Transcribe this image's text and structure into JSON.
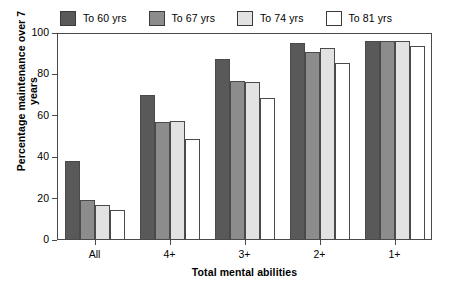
{
  "chart_data": {
    "type": "bar",
    "title": "",
    "xlabel": "Total mental abilities",
    "ylabel": "Percentage maintenance over 7 years",
    "categories": [
      "All",
      "4+",
      "3+",
      "2+",
      "1+"
    ],
    "ylim": [
      0,
      100
    ],
    "yticks": [
      0,
      20,
      40,
      60,
      80,
      100
    ],
    "grid": false,
    "legend_position": "top",
    "series": [
      {
        "name": "To 60 yrs",
        "color": "#595959",
        "values": [
          38,
          70,
          87.5,
          95,
          96
        ]
      },
      {
        "name": "To 67 yrs",
        "color": "#8c8c8c",
        "values": [
          19.5,
          57,
          77,
          91,
          96
        ]
      },
      {
        "name": "To 74 yrs",
        "color": "#e2e2e2",
        "values": [
          17,
          57.5,
          76.5,
          93,
          96
        ]
      },
      {
        "name": "To 81 yrs",
        "color": "#ffffff",
        "values": [
          14.5,
          49,
          68.5,
          85.5,
          93.5
        ]
      }
    ]
  }
}
